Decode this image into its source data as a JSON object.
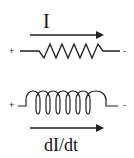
{
  "resistor": {
    "current_label": "I",
    "plus": "+",
    "minus": "-"
  },
  "inductor": {
    "rate_label": "dI/dt",
    "plus": "+",
    "minus": "-"
  },
  "colors": {
    "stroke": "#222222",
    "background": "#ffffff"
  }
}
